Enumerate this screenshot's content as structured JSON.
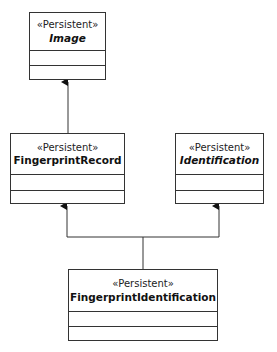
{
  "diagram": {
    "type": "UML class diagram",
    "line_color": "#333333",
    "classes": [
      {
        "id": "image",
        "stereotype": "«Persistent»",
        "name": "Image",
        "abstract": true,
        "attributes": [],
        "operations": []
      },
      {
        "id": "fingerprint-record",
        "stereotype": "«Persistent»",
        "name": "FingerprintRecord",
        "abstract": false,
        "attributes": [],
        "operations": []
      },
      {
        "id": "identification",
        "stereotype": "«Persistent»",
        "name": "Identification",
        "abstract": true,
        "attributes": [],
        "operations": []
      },
      {
        "id": "fingerprint-identification",
        "stereotype": "«Persistent»",
        "name": "FingerprintIdentification",
        "abstract": false,
        "attributes": [],
        "operations": []
      }
    ],
    "relationships": [
      {
        "type": "generalization",
        "from": "FingerprintRecord",
        "to": "Image"
      },
      {
        "type": "generalization",
        "from": "FingerprintIdentification",
        "to": "FingerprintRecord"
      },
      {
        "type": "generalization",
        "from": "FingerprintIdentification",
        "to": "Identification"
      }
    ]
  }
}
